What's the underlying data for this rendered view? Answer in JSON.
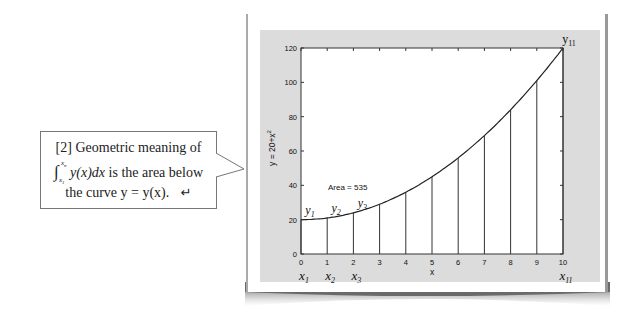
{
  "callout": {
    "line1": "[2] Geometric meaning of",
    "integral_symbol": "∫",
    "integral_upper": "x",
    "integral_upper_sub": "n",
    "integral_lower": "x",
    "integral_lower_sub": "1",
    "integrand": "y(x)dx",
    "line2_rest": " is the area below",
    "line3": "the curve y = y(x).",
    "return_glyph": "↵"
  },
  "chart_data": {
    "type": "area",
    "title": "",
    "xlabel": "x",
    "ylabel": "y = 20+x^2",
    "ylabel_main": "y = 20+x",
    "ylabel_sup": "2",
    "xlim": [
      0,
      10
    ],
    "ylim": [
      0,
      120
    ],
    "x_ticks": [
      "0",
      "1",
      "2",
      "3",
      "4",
      "5",
      "6",
      "7",
      "8",
      "9",
      "10"
    ],
    "y_ticks": [
      "0",
      "20",
      "40",
      "60",
      "80",
      "100",
      "120"
    ],
    "x": [
      0,
      1,
      2,
      3,
      4,
      5,
      6,
      7,
      8,
      9,
      10
    ],
    "values": [
      20,
      21,
      24,
      29,
      36,
      45,
      56,
      69,
      84,
      101,
      120
    ],
    "annotation": "Area = 535",
    "point_labels_y": [
      {
        "base": "y",
        "sub": "1",
        "x": 0
      },
      {
        "base": "y",
        "sub": "2",
        "x": 1
      },
      {
        "base": "y",
        "sub": "3",
        "x": 2
      },
      {
        "base": "y",
        "sub": "11",
        "x": 10
      }
    ],
    "point_labels_x": [
      {
        "base": "x",
        "sub": "1",
        "x": 0
      },
      {
        "base": "x",
        "sub": "2",
        "x": 1
      },
      {
        "base": "x",
        "sub": "3",
        "x": 2
      },
      {
        "base": "x",
        "sub": "11",
        "x": 10
      }
    ],
    "grid": false,
    "legend": "none"
  }
}
